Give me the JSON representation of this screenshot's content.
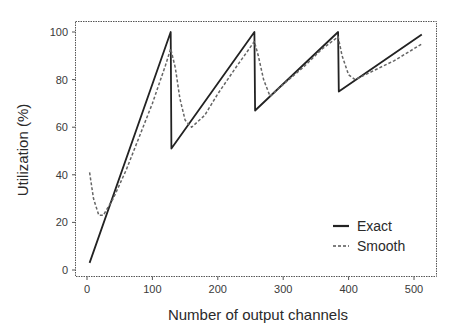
{
  "chart_data": {
    "type": "line",
    "title": "",
    "xlabel": "Number of output channels",
    "ylabel": "Utilization (%)",
    "xlim": [
      -15,
      540
    ],
    "ylim": [
      -3,
      105
    ],
    "xticks": [
      0,
      100,
      200,
      300,
      400,
      500
    ],
    "yticks": [
      0,
      20,
      40,
      60,
      80,
      100
    ],
    "grid": false,
    "legend_position": "lower right",
    "series": [
      {
        "name": "Exact",
        "style": "solid",
        "x": [
          4,
          128,
          129,
          256,
          257,
          384,
          385,
          512
        ],
        "y": [
          3,
          100,
          51,
          100,
          67,
          100,
          75,
          99
        ]
      },
      {
        "name": "Smooth",
        "style": "dashed",
        "x": [
          4,
          10,
          18,
          25,
          40,
          60,
          80,
          100,
          120,
          128,
          135,
          142,
          150,
          160,
          180,
          200,
          230,
          256,
          262,
          270,
          280,
          300,
          330,
          360,
          384,
          390,
          400,
          410,
          440,
          470,
          500,
          512
        ],
        "y": [
          41,
          30,
          23,
          23,
          30,
          42,
          56,
          70,
          86,
          93,
          85,
          72,
          63,
          60,
          65,
          74,
          86,
          96,
          90,
          80,
          73,
          78,
          85,
          93,
          98,
          90,
          82,
          80,
          84,
          88,
          93,
          95
        ]
      }
    ]
  },
  "labels": {
    "xlabel": "Number of output channels",
    "ylabel": "Utilization (%)",
    "legend_exact": "Exact",
    "legend_smooth": "Smooth"
  }
}
